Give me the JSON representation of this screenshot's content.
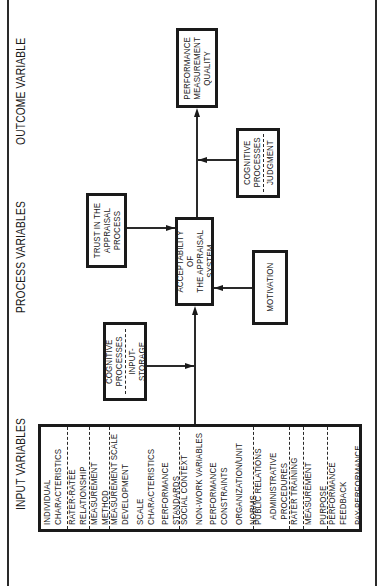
{
  "diagram": {
    "orientation": "rotated 90 degrees counter-clockwise",
    "sections": {
      "input": "INPUT VARIABLES",
      "process": "PROCESS VARIABLES",
      "outcome": "OUTCOME VARIABLE"
    },
    "input_box": {
      "groups": [
        {
          "items": [
            "INDIVIDUAL",
            "CHARACTERISTICS"
          ]
        },
        {
          "items": [
            "RATER-RATEE",
            "RELATIONSHIP"
          ]
        },
        {
          "items": [
            "MEASUREMENT",
            "METHOD"
          ]
        },
        {
          "items": [
            "MEASUREMENT SCALE",
            "DEVELOPMENT",
            "SCALE",
            "CHARACTERISTICS",
            "PERFORMANCE",
            "STANDARDS"
          ]
        },
        {
          "items": [
            "SOCIAL CONTEXT",
            "NON-WORK VARIABLES",
            "PERFORMANCE",
            "CONSTRAINTS",
            "ORGANIZATION/UNIT",
            "NORMS"
          ]
        },
        {
          "items": [
            "PUBLIC RELATIONS",
            "ADMINISTRATIVE",
            "PROCEDURES"
          ]
        },
        {
          "items": [
            "RATER TRAINING"
          ]
        },
        {
          "items": [
            "MEASUREMENT",
            "PURPOSE"
          ]
        },
        {
          "items": [
            "PERFORMANCE",
            "FEEDBACK",
            "PAY-PERFORMANCE"
          ]
        }
      ]
    },
    "process_boxes": {
      "cognitive_input": {
        "top": [
          "COGNITIVE",
          "PROCESSES"
        ],
        "bottom": [
          "INPUT-STORAGE"
        ]
      },
      "trust": [
        "TRUST IN THE",
        "APPRAISAL",
        "PROCESS"
      ],
      "acceptability": [
        "ACCEPTABILITY OF",
        "THE APPRAISAL",
        "SYSTEM"
      ],
      "motivation": [
        "MOTIVATION"
      ],
      "cognitive_judgment": {
        "top": [
          "COGNITIVE",
          "PROCESSES"
        ],
        "bottom": [
          "JUDGMENT"
        ]
      }
    },
    "outcome_box": [
      "PERFORMANCE",
      "MEASUREMENT",
      "QUALITY"
    ],
    "edges": [
      {
        "from": "input_box",
        "to": "acceptability"
      },
      {
        "from": "cognitive_input",
        "to": "input-to-acceptability line"
      },
      {
        "from": "trust",
        "to": "acceptability"
      },
      {
        "from": "motivation",
        "to": "acceptability"
      },
      {
        "from": "acceptability",
        "to": "outcome_box"
      },
      {
        "from": "cognitive_judgment",
        "to": "acceptability-to-outcome line"
      }
    ]
  }
}
